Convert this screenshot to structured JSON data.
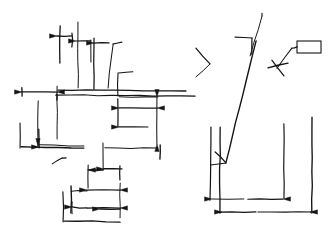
{
  "document": {
    "title": "Hand-drawn dimension sketch",
    "background_color": "#ffffff",
    "ink_color": "#141414",
    "width": 328,
    "height": 232
  },
  "drawing": {
    "description": "Freehand engineering sketch: two groups of dimension lines with arrowheads, extension lines, a leader line terminating in an empty rectangular callout box, and a bracket-shaped profile outline.",
    "left_group": {
      "name": "stepped-profile-dimension-cluster",
      "label": ""
    },
    "right_group": {
      "name": "u-channel-profile-with-leader",
      "label": ""
    },
    "callout": {
      "name": "empty-callout-box",
      "text": ""
    },
    "annotations": []
  },
  "strokes": {
    "left_cluster": [
      "M 57,86 L 57,139",
      "M 56,95 L 195,96",
      "M 57,94 L 57,100",
      "M 58,90 L 186,91",
      "M 22,92 L 57,92",
      "M 22,88 L 22,96",
      "M 38,101 L 38,146",
      "M 39,145 L 84,146",
      "M 118,73 L 118,96",
      "M 119,73 L 133,72",
      "M 119,97 L 158,97",
      "M 157,97 L 157,144",
      "M 118,99 L 118,127",
      "M 119,108 L 157,108",
      "M 119,127 L 148,127",
      "M 60,26 L 60,63",
      "M 57,36 L 72,36",
      "M 72,33 L 72,47",
      "M 78,22 L 78,88",
      "M 76,41 L 91,41",
      "M 91,40 L 91,62",
      "M 94,43 L 109,43",
      "M 94,38 L 94,89",
      "M 113,45 L 108,88",
      "M 113,44 L 122,42",
      "M 20,123 L 20,148",
      "M 21,147 L 84,148",
      "M 39,129 L 39,148",
      "M 160,145 L 160,159",
      "M 105,148 L 157,148",
      "M 52,164 L 62,158",
      "M 62,158 L 66,158",
      "M 103,143 L 103,170",
      "M 104,169 L 122,169",
      "M 120,166 L 120,180",
      "M 88,170 L 103,170",
      "M 88,165 L 88,188",
      "M 120,183 L 120,218",
      "M 87,190 L 120,190",
      "M 71,191 L 87,191",
      "M 71,186 L 71,213",
      "M 63,192 L 63,222",
      "M 64,221 L 120,222",
      "M 87,208 L 120,208",
      "M 72,207 L 87,208",
      "M 72,202 L 72,214",
      "M 100,209 L 120,209"
    ],
    "right_cluster": [
      "M 196,48 L 210,64",
      "M 210,64 L 196,77",
      "M 235,37 L 252,38",
      "M 252,38 L 252,54",
      "M 262,13 L 262,16",
      "M 262,16 L 250,56",
      "M 272,60 L 284,76",
      "M 268,68 L 288,63",
      "M 277,68 L 292,48",
      "M 292,48 L 297,47",
      "M 220,213 L 220,127",
      "M 220,212 L 256,212",
      "M 258,212 L 312,212",
      "M 312,213 L 312,117",
      "M 210,200 L 211,127",
      "M 212,199 L 244,199",
      "M 248,199 L 283,199",
      "M 284,198 L 284,124",
      "M 256,41 L 226,163",
      "M 226,163 L 215,152",
      "M 226,163 L 211,165"
    ],
    "arrowheads": [
      {
        "x": 57,
        "y": 92,
        "dir": "left"
      },
      {
        "x": 22,
        "y": 92,
        "dir": "right"
      },
      {
        "x": 38,
        "y": 146,
        "dir": "down"
      },
      {
        "x": 57,
        "y": 36,
        "dir": "right"
      },
      {
        "x": 76,
        "y": 41,
        "dir": "right"
      },
      {
        "x": 94,
        "y": 43,
        "dir": "right"
      },
      {
        "x": 119,
        "y": 108,
        "dir": "right"
      },
      {
        "x": 157,
        "y": 108,
        "dir": "left"
      },
      {
        "x": 119,
        "y": 127,
        "dir": "right"
      },
      {
        "x": 157,
        "y": 97,
        "dir": "down"
      },
      {
        "x": 157,
        "y": 144,
        "dir": "up"
      },
      {
        "x": 39,
        "y": 147,
        "dir": "right"
      },
      {
        "x": 104,
        "y": 169,
        "dir": "right"
      },
      {
        "x": 88,
        "y": 170,
        "dir": "left"
      },
      {
        "x": 87,
        "y": 190,
        "dir": "right"
      },
      {
        "x": 120,
        "y": 190,
        "dir": "left"
      },
      {
        "x": 72,
        "y": 207,
        "dir": "right"
      },
      {
        "x": 100,
        "y": 209,
        "dir": "right"
      },
      {
        "x": 120,
        "y": 208,
        "dir": "left"
      },
      {
        "x": 212,
        "y": 199,
        "dir": "right"
      },
      {
        "x": 283,
        "y": 199,
        "dir": "left"
      },
      {
        "x": 222,
        "y": 212,
        "dir": "right"
      },
      {
        "x": 310,
        "y": 212,
        "dir": "left"
      }
    ],
    "callout_box": {
      "x": 297,
      "y": 41,
      "width": 24,
      "height": 12
    }
  }
}
